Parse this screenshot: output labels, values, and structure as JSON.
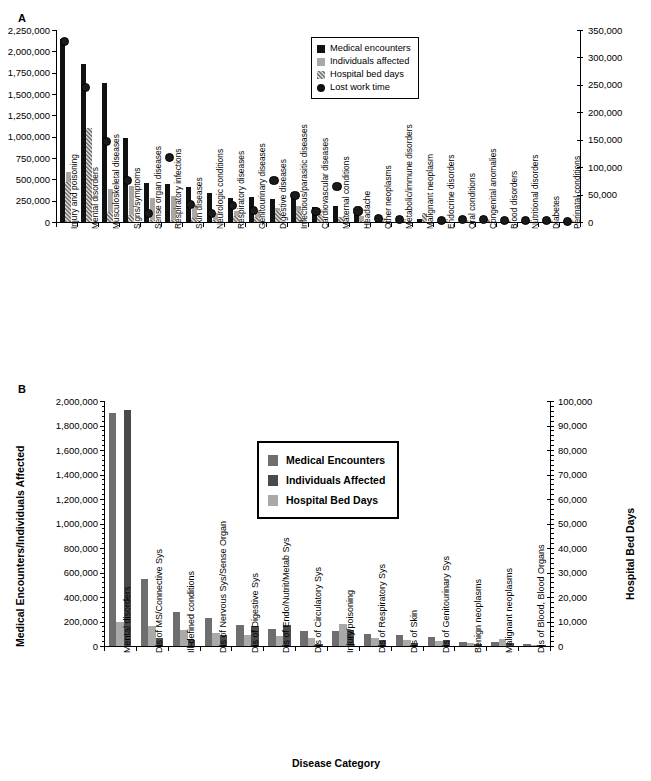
{
  "figure": {
    "panels": [
      {
        "letter": "A",
        "legend": [
          {
            "label": "Medical encounters",
            "key": "solid-black-square",
            "color": "#111111"
          },
          {
            "label": "Individuals affected",
            "key": "solid-gray-square",
            "color": "#a8a8a8"
          },
          {
            "label": "Hospital bed days",
            "key": "checkered-square",
            "color": "#8c8c8c"
          },
          {
            "label": "Lost work time",
            "key": "solid-black-circle",
            "color": "#111111"
          }
        ]
      },
      {
        "letter": "B",
        "legend": [
          {
            "label": "Medical Encounters",
            "key": "medium-gray-square",
            "color": "#6e6e6e"
          },
          {
            "label": "Individuals Affected",
            "key": "dark-gray-square",
            "color": "#4a4a4a"
          },
          {
            "label": "Hospital Bed Days",
            "key": "light-gray-square",
            "color": "#a9a9a9"
          }
        ]
      }
    ]
  },
  "chart_data": [
    {
      "type": "bar",
      "panel": "A",
      "title": "",
      "xlabel": "",
      "ylabel": "",
      "y2label": "",
      "ylim": [
        0,
        2250000
      ],
      "ylim2": [
        0,
        350000
      ],
      "yticks": [
        "0",
        "250,000",
        "500,000",
        "750,000",
        "1,000,000",
        "1,250,000",
        "1,500,000",
        "1,750,000",
        "2,000,000",
        "2,250,000"
      ],
      "ytick_values": [
        0,
        250000,
        500000,
        750000,
        1000000,
        1250000,
        1500000,
        1750000,
        2000000,
        2250000
      ],
      "y2ticks": [
        "0",
        "50,000",
        "100,000",
        "150,000",
        "200,000",
        "250,000",
        "300,000",
        "350,000"
      ],
      "y2tick_values": [
        0,
        50000,
        100000,
        150000,
        200000,
        250000,
        300000,
        350000
      ],
      "grid": false,
      "legend_position": "upper-center",
      "categories": [
        "Injury and poisoning",
        "Mental disorders",
        "Musculoskeletal diseases",
        "Signs/symptoms",
        "Sense organ diseases",
        "Respiratory infections",
        "Skin diseases",
        "Neurologic conditions",
        "Respiratory diseases",
        "Genitourinary diseases",
        "Digestive diseases",
        "Infectious/parasitic diseases",
        "Cardiovascular diseases",
        "Maternal conditions",
        "Headache",
        "Other neoplasms",
        "Metabolic/immune disorders",
        "Malignant neoplasm",
        "Endocrine disorders",
        "Oral conditions",
        "Congenital anomalies",
        "Blood disorders",
        "Nutritional disorders",
        "Diabetes",
        "Perinatal conditions"
      ],
      "series": [
        {
          "name": "Medical encounters",
          "axis": "left",
          "values": [
            2140000,
            1855000,
            1625000,
            980000,
            455000,
            440000,
            405000,
            340000,
            285000,
            290000,
            270000,
            280000,
            175000,
            190000,
            160000,
            60000,
            38000,
            35000,
            28000,
            26000,
            24000,
            20000,
            16000,
            14000,
            10000
          ]
        },
        {
          "name": "Individuals affected",
          "axis": "left",
          "values": [
            590000,
            225000,
            385000,
            420000,
            285000,
            305000,
            195000,
            105000,
            130000,
            140000,
            165000,
            185000,
            95000,
            45000,
            70000,
            48000,
            35000,
            70000,
            30000,
            28000,
            26000,
            22000,
            18000,
            15000,
            11000
          ]
        },
        {
          "name": "Hospital bed days",
          "axis": "right",
          "values": [
            73000,
            172000,
            19000,
            12000,
            3000,
            3000,
            7000,
            3000,
            11000,
            10000,
            20000,
            20000,
            11000,
            9000,
            2000,
            4000,
            4000,
            17000,
            3000,
            3000,
            5000,
            4000,
            2000,
            3000,
            3000
          ]
        },
        {
          "name": "Lost work time",
          "axis": "left",
          "values": [
            2125000,
            1590000,
            955000,
            500000,
            110000,
            765000,
            220000,
            115000,
            205000,
            145000,
            495000,
            320000,
            135000,
            425000,
            140000,
            48000,
            38000,
            null,
            30000,
            45000,
            38000,
            30000,
            28000,
            26000,
            22000
          ]
        }
      ]
    },
    {
      "type": "bar",
      "panel": "B",
      "title": "",
      "xlabel": "Disease Category",
      "ylabel": "Medical Encounters/Individuals Affected",
      "y2label": "Hospital Bed Days",
      "ylim": [
        0,
        2000000
      ],
      "ylim2": [
        0,
        100000
      ],
      "yticks": [
        "0",
        "200,000",
        "400,000",
        "600,000",
        "800,000",
        "1,000,000",
        "1,200,000",
        "1,400,000",
        "1,600,000",
        "1,800,000",
        "2,000,000"
      ],
      "ytick_values": [
        0,
        200000,
        400000,
        600000,
        800000,
        1000000,
        1200000,
        1400000,
        1600000,
        1800000,
        2000000
      ],
      "y2ticks": [
        "0",
        "10,000",
        "20,000",
        "30,000",
        "40,000",
        "50,000",
        "60,000",
        "70,000",
        "80,000",
        "90,000",
        "100,000"
      ],
      "y2tick_values": [
        0,
        10000,
        20000,
        30000,
        40000,
        50000,
        60000,
        70000,
        80000,
        90000,
        100000
      ],
      "grid": false,
      "legend_position": "upper-center",
      "categories": [
        "Mental disorders",
        "Dis of MS/Connective Sys",
        "Ill-defined conditions",
        "Dis of Nervous Sys/Sense Organ",
        "Dis of Digestive Sys",
        "Dis of Endo/Nutrit/Metab Sys",
        "Dis of Circulatory Sys",
        "Injury/poisoning",
        "Dis of Respiratory Sys",
        "Dis of Skin",
        "Dis of Genitourinary Sys",
        "Benign neoplasms",
        "Malignant neoplasms",
        "Dis of Blood, Blood Organs"
      ],
      "series": [
        {
          "name": "Medical Encounters",
          "axis": "left",
          "values": [
            1905000,
            545000,
            280000,
            225000,
            175000,
            140000,
            125000,
            120000,
            100000,
            92000,
            72000,
            32000,
            30000,
            14000
          ]
        },
        {
          "name": "Individuals Affected",
          "axis": "left",
          "values": [
            1930000,
            65000,
            45000,
            88000,
            160000,
            175000,
            20000,
            130000,
            48000,
            22000,
            46000,
            16000,
            22000,
            6000
          ]
        },
        {
          "name": "Hospital Bed Days",
          "axis": "right",
          "values": [
            10000,
            8200,
            6700,
            5200,
            4500,
            4100,
            3400,
            9000,
            3300,
            2500,
            2000,
            1100,
            3000,
            600
          ]
        }
      ]
    }
  ]
}
